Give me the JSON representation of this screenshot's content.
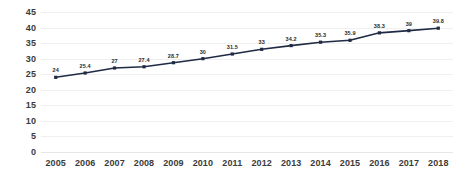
{
  "chart_data": {
    "type": "line",
    "title": "",
    "subtitle": "",
    "xlabel": "",
    "ylabel": "",
    "categories": [
      "2005",
      "2006",
      "2007",
      "2008",
      "2009",
      "2010",
      "2011",
      "2012",
      "2013",
      "2014",
      "2015",
      "2016",
      "2017",
      "2018"
    ],
    "values": [
      24,
      25.4,
      27,
      27.4,
      28.7,
      30,
      31.5,
      33,
      34.2,
      35.3,
      35.9,
      38.3,
      39,
      39.8
    ],
    "point_labels": [
      "24",
      "25.4",
      "27",
      "27.4",
      "28.7",
      "30",
      "31.5",
      "33",
      "34.2",
      "35.3",
      "35.9",
      "38.3",
      "39",
      "39.8"
    ],
    "ylim": [
      0,
      45
    ],
    "xlim_categories": true,
    "y_ticks": [
      "0",
      "5",
      "10",
      "15",
      "20",
      "25",
      "30",
      "35",
      "40",
      "45"
    ],
    "y_tick_values": [
      0,
      5,
      10,
      15,
      20,
      25,
      30,
      35,
      40,
      45
    ],
    "x_ticks": [
      "2005",
      "2006",
      "2007",
      "2008",
      "2009",
      "2010",
      "2011",
      "2012",
      "2013",
      "2014",
      "2015",
      "2016",
      "2017",
      "2018"
    ],
    "grid": true,
    "grid_axis": "y",
    "legend": false,
    "legend_position": "none",
    "markers": "square",
    "data_labels_shown": true
  },
  "style": {
    "line_color": "#1f2a44",
    "marker_color": "#1f2a44",
    "grid_color": "#f0f0f0",
    "baseline_color": "#e6e6e6",
    "tick_label_color": "#3b3b3b",
    "data_label_color": "#2b2b2b",
    "plot_background": "#ffffff",
    "page_background": "#ffffff"
  }
}
